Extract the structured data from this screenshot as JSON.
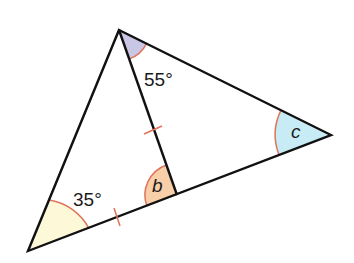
{
  "diagram": {
    "type": "triangle-with-cevian",
    "vertices": {
      "top": [
        119,
        30
      ],
      "right": [
        331,
        135
      ],
      "bottom_left": [
        28,
        251
      ],
      "cevian_foot": [
        177,
        195
      ]
    },
    "angles": [
      {
        "id": "top",
        "label": "55°",
        "fill": "#c9c6e6"
      },
      {
        "id": "right",
        "label": "c",
        "fill": "#c8ecf6"
      },
      {
        "id": "foot",
        "label": "b",
        "fill": "#f8cfa8"
      },
      {
        "id": "bottom_left",
        "label": "35°",
        "fill": "#fdf8d8"
      }
    ],
    "equal_marks": "Cevian from top vertex to base equals the left part of the base (tick marks)",
    "colors": {
      "line": "#111111",
      "arc": "#e0735a",
      "tick": "#e0735a"
    }
  }
}
